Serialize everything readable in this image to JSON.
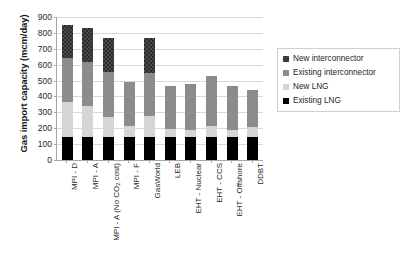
{
  "chart_data": {
    "type": "bar",
    "subtype": "stacked-vertical",
    "title": "",
    "xlabel": "",
    "ylabel": "Gas import capacity (mcm/day)",
    "ylim": [
      0,
      900
    ],
    "ytick_step": 100,
    "ytick_labels": [
      "0",
      "100",
      "200",
      "300",
      "400",
      "500",
      "600",
      "700",
      "800",
      "900"
    ],
    "ytick_values": [
      0,
      100,
      200,
      300,
      400,
      500,
      600,
      700,
      800,
      900
    ],
    "grid": true,
    "grid_axis": "y",
    "legend_position": "right",
    "categories": [
      "MPI - D",
      "MPI - A",
      "MPI - A (No CO₂ cost)",
      "MPI - F",
      "GasWorld",
      "LEB",
      "EHT - Nuclear",
      "EHT - CCS",
      "EHT - Offshore",
      "DDBT"
    ],
    "series": [
      {
        "name": "Existing LNG",
        "color": "#000000",
        "pattern": "solid",
        "values": [
          145,
          145,
          145,
          145,
          145,
          145,
          145,
          145,
          145,
          145
        ]
      },
      {
        "name": "New LNG",
        "color": "#d5d5d5",
        "pattern": "solid",
        "values": [
          220,
          195,
          125,
          70,
          130,
          50,
          45,
          70,
          45,
          60
        ]
      },
      {
        "name": "Existing interconnector",
        "color": "#8c8c8c",
        "pattern": "solid",
        "values": [
          275,
          280,
          285,
          275,
          275,
          270,
          290,
          315,
          275,
          235
        ]
      },
      {
        "name": "New interconnector",
        "color": "#3b3b3b",
        "pattern": "checkered",
        "values": [
          210,
          210,
          215,
          0,
          215,
          0,
          0,
          0,
          0,
          0
        ]
      }
    ],
    "totals": [
      850,
      830,
      770,
      490,
      765,
      465,
      480,
      530,
      465,
      440
    ]
  },
  "legend": {
    "items": [
      {
        "label": "New interconnector",
        "swatch": "checkered-dark"
      },
      {
        "label": "Existing interconnector",
        "swatch": "mid-gray"
      },
      {
        "label": "New LNG",
        "swatch": "light-gray"
      },
      {
        "label": "Existing LNG",
        "swatch": "black"
      }
    ]
  }
}
